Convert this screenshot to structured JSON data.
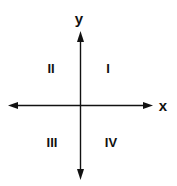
{
  "diagram": {
    "axes": {
      "x_label": "x",
      "y_label": "y"
    },
    "quadrants": [
      {
        "id": "I",
        "label": "I"
      },
      {
        "id": "II",
        "label": "II"
      },
      {
        "id": "III",
        "label": "III"
      },
      {
        "id": "IV",
        "label": "IV"
      }
    ],
    "colors": {
      "line": "#111111",
      "background": "#ffffff"
    }
  }
}
